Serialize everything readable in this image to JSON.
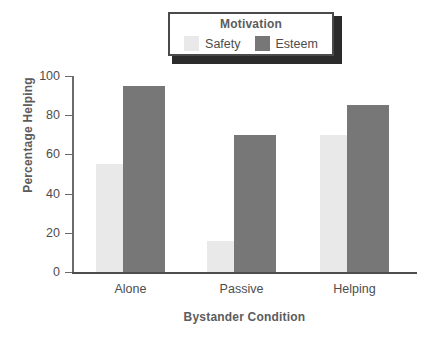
{
  "chart_data": {
    "type": "bar",
    "title": "",
    "xlabel": "Bystander Condition",
    "ylabel": "Percentage Helping",
    "categories": [
      "Alone",
      "Passive",
      "Helping"
    ],
    "series": [
      {
        "name": "Safety",
        "values": [
          55,
          16,
          70
        ],
        "color": "#e9e9e9"
      },
      {
        "name": "Esteem",
        "values": [
          95,
          70,
          85
        ],
        "color": "#777777"
      }
    ],
    "ylim": [
      0,
      100
    ],
    "yticks": [
      0,
      20,
      40,
      60,
      80,
      100
    ],
    "ytick_labels": [
      "0",
      "20",
      "40",
      "60",
      "80",
      "100"
    ],
    "grid": false,
    "legend": {
      "title": "Motivation",
      "position": "top-center",
      "entries": [
        {
          "label": "Safety",
          "swatch_color": "#e9e9e9"
        },
        {
          "label": "Esteem",
          "swatch_color": "#777777"
        }
      ]
    },
    "colors": {
      "safety": "#e9e9e9",
      "esteem": "#777777",
      "axis": "#4d4d4d",
      "text": "#4d4d4d",
      "title_text": "#5c5c5c",
      "legend_border": "#4a4a4a",
      "legend_shadow": "#2b2b2b",
      "background": "#ffffff"
    }
  }
}
